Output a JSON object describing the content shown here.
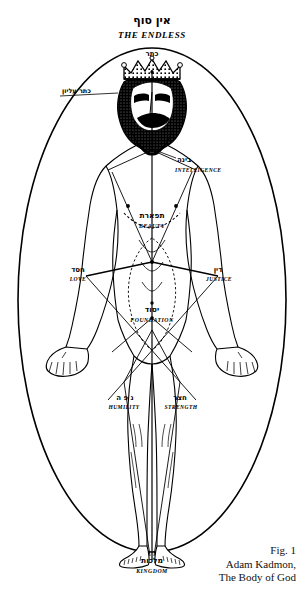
{
  "figure": {
    "title_hebrew": "אין סוף",
    "title_english": "THE ENDLESS",
    "caption_line1": "Fig. 1",
    "caption_line2": "Adam Kadmon,",
    "caption_line3": "The Body of God",
    "ink_color": "#000000",
    "paper_color": "#ffffff"
  },
  "sephirot": [
    {
      "id": "keter",
      "hebrew": "כתר",
      "english": "CROWN",
      "body_location": "crown-of-head"
    },
    {
      "id": "chokhmah",
      "hebrew": "חכמה",
      "english": "WISDOM",
      "body_location": "right-temple"
    },
    {
      "id": "binah",
      "hebrew": "בינה",
      "english": "INTELLIGENCE",
      "body_location": "left-shoulder"
    },
    {
      "id": "tiferet",
      "hebrew": "תפארת",
      "english": "BEAUTY",
      "body_location": "heart"
    },
    {
      "id": "chesed",
      "hebrew": "חסד",
      "english": "LOVE",
      "body_location": "right-arm"
    },
    {
      "id": "din",
      "hebrew": "דין",
      "english": "JUSTICE",
      "body_location": "left-arm"
    },
    {
      "id": "yesod",
      "hebrew": "יסוד",
      "english": "FOUNDATION",
      "body_location": "groin"
    },
    {
      "id": "hod",
      "hebrew": "נ פ ה",
      "english": "HUMILITY",
      "body_location": "right-leg"
    },
    {
      "id": "netzach",
      "hebrew": "חצר",
      "english": "STRENGTH",
      "body_location": "left-leg"
    },
    {
      "id": "malkhut",
      "hebrew": "מלכות",
      "english": "KINGDOM",
      "body_location": "feet"
    }
  ],
  "labels": {
    "ein_sof_hebrew": "אין סוף",
    "ein_sof_english": "THE ENDLESS",
    "keter_hebrew": "כתר",
    "crown_side_hebrew": "כתר עליון",
    "binah_hebrew": "בינה",
    "binah_english": "INTELLIGENCE",
    "tiferet_hebrew": "תפארת",
    "tiferet_english": "BEAUTY",
    "chesed_hebrew": "חסד",
    "chesed_english": "LOVE",
    "din_hebrew": "דין",
    "din_english": "JUSTICE",
    "yesod_hebrew": "יסוד",
    "yesod_english": "FOUNDATION",
    "hod_hebrew": "נ פ ה",
    "hod_english": "HUMILITY",
    "netzach_hebrew": "חצר",
    "netzach_english": "STRENGTH",
    "malkhut_hebrew": "מלכות",
    "malkhut_english": "KINGDOM"
  }
}
